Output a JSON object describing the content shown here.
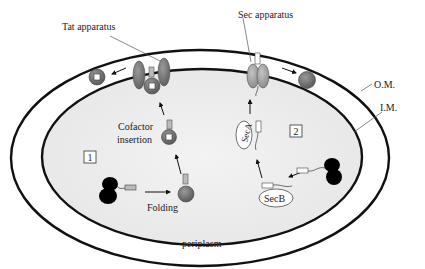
{
  "diagram": {
    "labels": {
      "tat_apparatus": "Tat apparatus",
      "sec_apparatus": "Sec apparatus",
      "outer_membrane": "O.M.",
      "inner_membrane": "I.M.",
      "cofactor_insertion_line1": "Cofactor",
      "cofactor_insertion_line2": "insertion",
      "folding": "Folding",
      "periplasm": "periplasm",
      "pathway_1": "1",
      "pathway_2": "2",
      "seca": "SecA",
      "secb": "SecB"
    },
    "colors": {
      "membrane": "#111111",
      "cytoplasm": "#ececec",
      "periplasm": "#ffffff",
      "protein": "#6e6e6e",
      "tat_protein": "#7a7a7a",
      "sec_protein": "#9a9a9a",
      "ribosome": "#000000",
      "signal_peptide": "#c8c8c8"
    }
  }
}
